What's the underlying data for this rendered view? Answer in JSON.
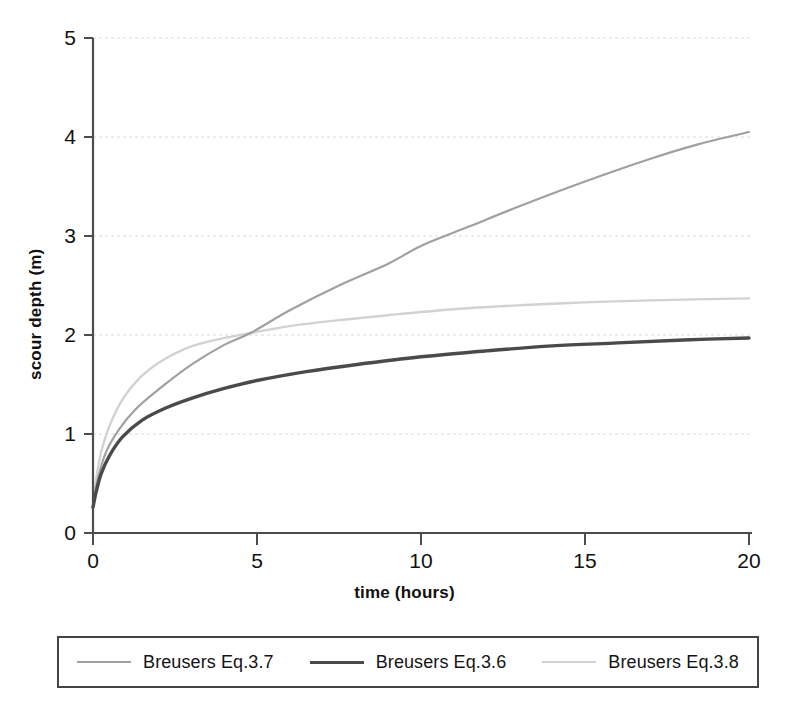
{
  "chart_data": {
    "type": "line",
    "title": "",
    "xlabel": "time (hours)",
    "ylabel": "scour depth (m)",
    "xlim": [
      0,
      20
    ],
    "ylim": [
      0,
      5
    ],
    "xticks": [
      "0",
      "5",
      "10",
      "15",
      "20"
    ],
    "yticks": [
      "0",
      "1",
      "2",
      "3",
      "4",
      "5"
    ],
    "grid": "horizontal-dotted-light",
    "legend_position": "below-plot-boxed",
    "series": [
      {
        "name": "Breusers Eq.3.7",
        "color": "#a0a0a0",
        "width": 2.2,
        "x": [
          0,
          0.15,
          0.4,
          0.8,
          1.3,
          2,
          3,
          4,
          4.8,
          6,
          7.5,
          9,
          10,
          11.5,
          13,
          15,
          17,
          18.5,
          20
        ],
        "y": [
          0.27,
          0.55,
          0.82,
          1.05,
          1.25,
          1.45,
          1.7,
          1.9,
          2.02,
          2.25,
          2.5,
          2.72,
          2.9,
          3.1,
          3.3,
          3.55,
          3.78,
          3.93,
          4.05
        ]
      },
      {
        "name": "Breusers Eq.3.6",
        "color": "#4a4a4a",
        "width": 3.4,
        "x": [
          0,
          0.1,
          0.25,
          0.5,
          0.9,
          1.5,
          2.2,
          3,
          4,
          5,
          6.5,
          8,
          10,
          12,
          14,
          16,
          18,
          20
        ],
        "y": [
          0.26,
          0.42,
          0.6,
          0.78,
          0.97,
          1.14,
          1.26,
          1.36,
          1.46,
          1.54,
          1.63,
          1.7,
          1.78,
          1.84,
          1.89,
          1.92,
          1.95,
          1.97
        ]
      },
      {
        "name": "Breusers Eq.3.8",
        "color": "#d2d2d2",
        "width": 2.4,
        "x": [
          0,
          0.1,
          0.25,
          0.5,
          0.9,
          1.4,
          2,
          2.8,
          3.6,
          4.8,
          6,
          7.5,
          9,
          11,
          13,
          15,
          17,
          20
        ],
        "y": [
          0.27,
          0.55,
          0.82,
          1.08,
          1.35,
          1.56,
          1.72,
          1.86,
          1.94,
          2.02,
          2.09,
          2.15,
          2.2,
          2.26,
          2.3,
          2.33,
          2.35,
          2.37
        ]
      }
    ]
  },
  "axes": {
    "y_tick_labels": [
      "5",
      "4",
      "3",
      "2",
      "1",
      "0"
    ],
    "x_tick_labels": [
      "0",
      "5",
      "10",
      "15",
      "20"
    ],
    "y_title": "scour depth (m)",
    "x_title": "time (hours)"
  },
  "legend": {
    "entries": [
      {
        "label": "Breusers Eq.3.7",
        "color": "#a0a0a0",
        "width": 2.2
      },
      {
        "label": "Breusers Eq.3.6",
        "color": "#4a4a4a",
        "width": 3.4
      },
      {
        "label": "Breusers Eq.3.8",
        "color": "#d2d2d2",
        "width": 2.4
      }
    ]
  },
  "colors": {
    "axis": "#4d4d4d",
    "grid": "#d8d8d8",
    "text": "#111111",
    "legend_border": "#444444"
  }
}
